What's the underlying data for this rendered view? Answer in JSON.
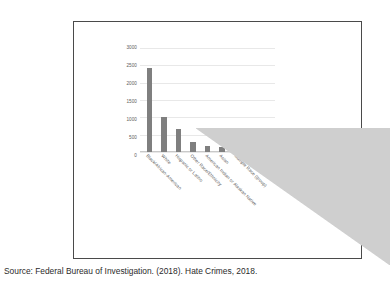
{
  "caption": "Source: Federal Bureau of Investigation. (2018). Hate Crimes, 2018.",
  "colors": {
    "bar": "#7f7f7f",
    "gridline": "#e8e8e8",
    "frame": "#4a4a4a",
    "artifact": "#cfcfcf",
    "tick_text": "#5c5c5c",
    "caption_text": "#2b2b2b"
  },
  "chart_data": {
    "type": "bar",
    "title": "",
    "xlabel": "",
    "ylabel": "",
    "ylim": [
      0,
      3000
    ],
    "yticks": [
      0,
      500,
      1000,
      1500,
      2000,
      2500,
      3000
    ],
    "ytick_labels": [
      "0",
      "500",
      "1000",
      "1500",
      "2000",
      "2500",
      "3000"
    ],
    "grid": true,
    "legend": false,
    "categories": [
      "Black/African-American",
      "White",
      "Hispanic or Latino",
      "Other Race/Ethnicity",
      "American Indian or Alaskan Native",
      "Asian",
      "Multiple Race (group)",
      "Arab",
      "Hawaiian/Pacific Islander"
    ],
    "values": [
      2426,
      1006,
      671,
      300,
      161,
      132,
      128,
      90,
      20
    ]
  }
}
